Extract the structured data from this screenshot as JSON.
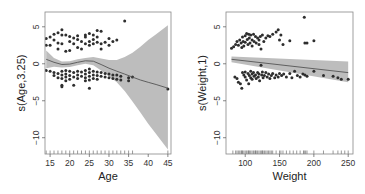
{
  "chart_data": [
    {
      "type": "scatter",
      "title": "",
      "xlabel": "Age",
      "ylabel": "s(Age,3.25)",
      "xlim": [
        13.7,
        45.8
      ],
      "ylim": [
        -12.2,
        7.0
      ],
      "xticks": [
        15,
        20,
        25,
        30,
        35,
        40,
        45
      ],
      "yticks": [
        5,
        0,
        -5,
        -10
      ],
      "grid": false,
      "legend": null,
      "smooth": {
        "x": [
          14,
          16,
          18,
          20,
          22,
          24,
          26,
          28,
          30,
          32,
          34,
          36,
          38,
          40,
          42,
          45
        ],
        "fit": [
          0.6,
          0.2,
          -0.1,
          -0.05,
          0.2,
          0.4,
          0.35,
          -0.1,
          -0.6,
          -1.0,
          -1.4,
          -1.8,
          -2.2,
          -2.5,
          -2.8,
          -3.3
        ],
        "upper": [
          1.8,
          0.8,
          0.3,
          0.35,
          0.6,
          0.8,
          0.9,
          0.7,
          0.5,
          0.5,
          0.9,
          1.5,
          2.3,
          3.2,
          4.0,
          5.2
        ],
        "lower": [
          -0.6,
          -0.4,
          -0.5,
          -0.45,
          -0.2,
          0.0,
          -0.2,
          -0.9,
          -1.7,
          -2.5,
          -3.7,
          -5.1,
          -6.6,
          -8.1,
          -9.5,
          -11.6
        ]
      },
      "points": [
        [
          14,
          3.4
        ],
        [
          14,
          2.5
        ],
        [
          15,
          3.6
        ],
        [
          15,
          2.5
        ],
        [
          16,
          4.0
        ],
        [
          16,
          3.2
        ],
        [
          17,
          4.2
        ],
        [
          17,
          2.8
        ],
        [
          18,
          4.6
        ],
        [
          18,
          3.9
        ],
        [
          18,
          2.7
        ],
        [
          17,
          2.0
        ],
        [
          19,
          3.9
        ],
        [
          19,
          1.7
        ],
        [
          20,
          3.7
        ],
        [
          20,
          3.0
        ],
        [
          20,
          1.8
        ],
        [
          21,
          3.5
        ],
        [
          21,
          2.7
        ],
        [
          22,
          3.8
        ],
        [
          22,
          2.2
        ],
        [
          22,
          3.3
        ],
        [
          23,
          3.0
        ],
        [
          23,
          2.0
        ],
        [
          24,
          3.9
        ],
        [
          24,
          2.7
        ],
        [
          24,
          3.6
        ],
        [
          25,
          4.1
        ],
        [
          25,
          3.0
        ],
        [
          25,
          2.5
        ],
        [
          26,
          3.9
        ],
        [
          26,
          3.3
        ],
        [
          26,
          2.7
        ],
        [
          27,
          4.5
        ],
        [
          27,
          3.6
        ],
        [
          27,
          2.9
        ],
        [
          28,
          4.4
        ],
        [
          28,
          2.7
        ],
        [
          28,
          2.0
        ],
        [
          29,
          2.9
        ],
        [
          30,
          3.4
        ],
        [
          30,
          2.5
        ],
        [
          31,
          3.0
        ],
        [
          32,
          3.2
        ],
        [
          34,
          5.8
        ],
        [
          14,
          -0.9
        ],
        [
          15,
          -1.0
        ],
        [
          16,
          -1.2
        ],
        [
          16,
          -1.6
        ],
        [
          17,
          -1.3
        ],
        [
          17,
          -1.9
        ],
        [
          18,
          -1.0
        ],
        [
          18,
          -1.5
        ],
        [
          18,
          -2.0
        ],
        [
          18,
          -2.9
        ],
        [
          18,
          -3.1
        ],
        [
          19,
          -0.9
        ],
        [
          19,
          -1.4
        ],
        [
          19,
          -1.8
        ],
        [
          19,
          -2.3
        ],
        [
          20,
          -1.0
        ],
        [
          20,
          -1.6
        ],
        [
          20,
          -2.1
        ],
        [
          21,
          -1.2
        ],
        [
          21,
          -1.8
        ],
        [
          21,
          -2.9
        ],
        [
          22,
          -1.0
        ],
        [
          22,
          -1.5
        ],
        [
          22,
          -2.0
        ],
        [
          23,
          -1.1
        ],
        [
          23,
          -1.7
        ],
        [
          24,
          -0.9
        ],
        [
          24,
          -1.4
        ],
        [
          24,
          -1.9
        ],
        [
          24,
          -2.3
        ],
        [
          25,
          -0.7
        ],
        [
          25,
          -1.2
        ],
        [
          25,
          -1.7
        ],
        [
          25,
          -2.2
        ],
        [
          25,
          -3.3
        ],
        [
          26,
          -1.0
        ],
        [
          26,
          -1.5
        ],
        [
          26,
          -2.0
        ],
        [
          27,
          -1.1
        ],
        [
          27,
          -1.6
        ],
        [
          27,
          -2.1
        ],
        [
          28,
          -1.2
        ],
        [
          28,
          -1.7
        ],
        [
          29,
          -1.3
        ],
        [
          29,
          -1.8
        ],
        [
          30,
          -1.4
        ],
        [
          30,
          -1.9
        ],
        [
          31,
          -1.5
        ],
        [
          31,
          -2.0
        ],
        [
          32,
          -1.5
        ],
        [
          32,
          -2.1
        ],
        [
          33,
          -1.7
        ],
        [
          33,
          -2.2
        ],
        [
          35,
          -1.9
        ],
        [
          35,
          -2.3
        ],
        [
          36,
          -1.8
        ],
        [
          45,
          -3.4
        ]
      ],
      "rug": [
        14,
        15,
        16,
        17,
        18,
        19,
        20,
        21,
        22,
        23,
        24,
        25,
        26,
        27,
        28,
        29,
        30,
        31,
        32,
        33,
        34,
        35,
        36,
        45
      ]
    },
    {
      "type": "scatter",
      "title": "",
      "xlabel": "Weight",
      "ylabel": "s(Weight,1)",
      "xlim": [
        72,
        257
      ],
      "ylim": [
        -12.2,
        7.0
      ],
      "xticks": [
        100,
        150,
        200,
        250
      ],
      "yticks": [
        5,
        0,
        -5,
        -10
      ],
      "grid": false,
      "legend": null,
      "smooth": {
        "x": [
          80,
          250
        ],
        "fit": [
          0.6,
          -1.2
        ],
        "upper": [
          1.0,
          0.3
        ],
        "lower": [
          0.2,
          -2.5
        ]
      },
      "points": [
        [
          80,
          2.1
        ],
        [
          83,
          2.3
        ],
        [
          86,
          2.6
        ],
        [
          88,
          3.0
        ],
        [
          90,
          2.5
        ],
        [
          92,
          3.2
        ],
        [
          94,
          2.8
        ],
        [
          95,
          2.2
        ],
        [
          96,
          3.6
        ],
        [
          97,
          3.0
        ],
        [
          98,
          2.4
        ],
        [
          100,
          3.8
        ],
        [
          100,
          2.9
        ],
        [
          102,
          4.1
        ],
        [
          103,
          3.3
        ],
        [
          104,
          2.6
        ],
        [
          105,
          4.0
        ],
        [
          106,
          3.5
        ],
        [
          107,
          2.8
        ],
        [
          108,
          3.9
        ],
        [
          110,
          3.2
        ],
        [
          110,
          2.4
        ],
        [
          112,
          4.0
        ],
        [
          113,
          3.0
        ],
        [
          115,
          3.7
        ],
        [
          116,
          2.8
        ],
        [
          118,
          3.5
        ],
        [
          120,
          3.2
        ],
        [
          120,
          2.6
        ],
        [
          122,
          3.7
        ],
        [
          123,
          2.0
        ],
        [
          125,
          3.9
        ],
        [
          127,
          3.0
        ],
        [
          130,
          3.5
        ],
        [
          133,
          3.8
        ],
        [
          136,
          3.7
        ],
        [
          140,
          4.0
        ],
        [
          145,
          4.3
        ],
        [
          148,
          4.6
        ],
        [
          150,
          3.2
        ],
        [
          152,
          3.9
        ],
        [
          155,
          2.6
        ],
        [
          165,
          3.1
        ],
        [
          186,
          6.3
        ],
        [
          187,
          2.8
        ],
        [
          190,
          2.8
        ],
        [
          200,
          3.1
        ],
        [
          85,
          -1.8
        ],
        [
          88,
          -2.0
        ],
        [
          90,
          -2.5
        ],
        [
          93,
          -2.7
        ],
        [
          95,
          -3.3
        ],
        [
          96,
          -1.2
        ],
        [
          98,
          -1.5
        ],
        [
          100,
          -1.1
        ],
        [
          100,
          -1.8
        ],
        [
          102,
          -2.2
        ],
        [
          104,
          -1.3
        ],
        [
          105,
          -2.7
        ],
        [
          106,
          -1.6
        ],
        [
          108,
          -1.0
        ],
        [
          108,
          -1.9
        ],
        [
          110,
          -1.4
        ],
        [
          110,
          -2.1
        ],
        [
          112,
          -1.2
        ],
        [
          113,
          -1.7
        ],
        [
          115,
          -1.5
        ],
        [
          116,
          -2.0
        ],
        [
          118,
          -1.2
        ],
        [
          119,
          -1.8
        ],
        [
          120,
          -1.4
        ],
        [
          121,
          -2.3
        ],
        [
          123,
          -0.2
        ],
        [
          124,
          -1.5
        ],
        [
          125,
          -1.1
        ],
        [
          126,
          -1.9
        ],
        [
          128,
          -1.6
        ],
        [
          130,
          -1.2
        ],
        [
          132,
          -1.8
        ],
        [
          134,
          -1.4
        ],
        [
          136,
          -2.0
        ],
        [
          138,
          -1.6
        ],
        [
          140,
          -1.3
        ],
        [
          143,
          -1.9
        ],
        [
          145,
          -1.5
        ],
        [
          148,
          -1.8
        ],
        [
          150,
          -1.3
        ],
        [
          153,
          -1.6
        ],
        [
          156,
          -1.4
        ],
        [
          160,
          -1.8
        ],
        [
          165,
          -1.3
        ],
        [
          168,
          -1.9
        ],
        [
          172,
          -1.0
        ],
        [
          176,
          -1.6
        ],
        [
          180,
          -1.8
        ],
        [
          184,
          -1.4
        ],
        [
          187,
          -1.5
        ],
        [
          190,
          -1.7
        ],
        [
          200,
          -1.0
        ],
        [
          214,
          -1.6
        ],
        [
          228,
          -1.7
        ],
        [
          235,
          -1.9
        ],
        [
          240,
          -2.1
        ],
        [
          250,
          -2.1
        ]
      ],
      "rug": [
        82,
        86,
        88,
        90,
        92,
        94,
        95,
        96,
        98,
        100,
        102,
        104,
        105,
        106,
        108,
        110,
        112,
        114,
        115,
        116,
        118,
        120,
        122,
        124,
        125,
        126,
        128,
        130,
        132,
        134,
        136,
        138,
        140,
        145,
        150,
        152,
        155,
        160,
        165,
        170,
        175,
        180,
        185,
        186,
        188,
        190,
        200,
        214,
        228,
        235,
        240,
        245,
        250
      ]
    }
  ]
}
